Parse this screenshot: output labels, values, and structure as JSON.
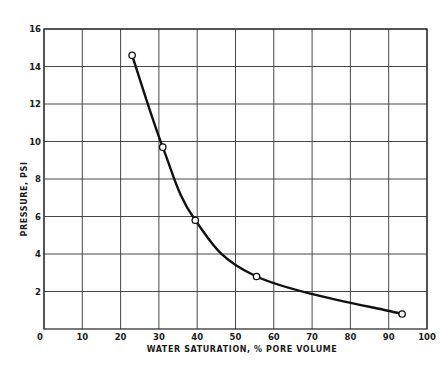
{
  "chart_data": {
    "type": "line",
    "title": "",
    "xlabel": "WATER SATURATION, % PORE VOLUME",
    "ylabel": "PRESSURE, PSI",
    "xlim": [
      0,
      100
    ],
    "ylim": [
      0,
      16
    ],
    "grid": true,
    "x_ticks": [
      "0",
      "10",
      "20",
      "30",
      "40",
      "50",
      "60",
      "70",
      "80",
      "90",
      "100"
    ],
    "y_ticks": [
      "2",
      "4",
      "6",
      "8",
      "10",
      "12",
      "14",
      "16"
    ],
    "series": [
      {
        "name": "Capillary pressure curve",
        "marker": "open-circle",
        "x": [
          23,
          31,
          39.5,
          55.5,
          93.5
        ],
        "y": [
          14.6,
          9.7,
          5.8,
          2.8,
          0.8
        ]
      }
    ],
    "legend": null,
    "colors": {
      "line": "#111111",
      "grid": "#333333",
      "marker_fill": "#ffffff"
    }
  },
  "labels": {
    "x_axis": "WATER SATURATION, % PORE VOLUME",
    "y_axis": "PRESSURE, PSI",
    "origin": "0"
  }
}
